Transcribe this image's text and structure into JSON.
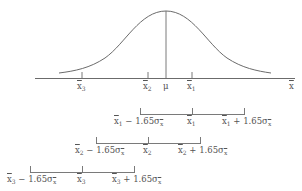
{
  "diagram": {
    "type": "confidence-intervals-on-normal-distribution",
    "colors": {
      "line": "#6b6b6b",
      "text": "#555555",
      "background": "#ffffff"
    },
    "axis": {
      "label": "x̄",
      "ticks": [
        {
          "name": "x3",
          "label": "x̄3",
          "base": "x",
          "sub": "3"
        },
        {
          "name": "x2",
          "label": "x̄2",
          "base": "x",
          "sub": "2"
        },
        {
          "name": "mu",
          "label": "μ"
        },
        {
          "name": "x1",
          "label": "x̄1",
          "base": "x",
          "sub": "1"
        }
      ]
    },
    "intervals": [
      {
        "center": "x̄1",
        "sub": "1",
        "lower": "x̄1 − 1.65σx̄",
        "mid": "x̄1",
        "upper": "x̄1 + 1.65σx̄",
        "minus_text": " − 1.65σ",
        "plus_text": " + 1.65σ"
      },
      {
        "center": "x̄2",
        "sub": "2",
        "lower": "x̄2 − 1.65σx̄",
        "mid": "x̄2",
        "upper": "x̄2 + 1.65σx̄",
        "minus_text": " − 1.65σ",
        "plus_text": " + 1.65σ"
      },
      {
        "center": "x̄3",
        "sub": "3",
        "lower": "x̄3 − 1.65σx̄",
        "mid": "x̄3",
        "upper": "x̄3 + 1.65σx̄",
        "minus_text": " − 1.65σ",
        "plus_text": " + 1.65σ"
      }
    ],
    "x_letter": "x",
    "mu_label": "μ",
    "axis_end_label": "x"
  }
}
